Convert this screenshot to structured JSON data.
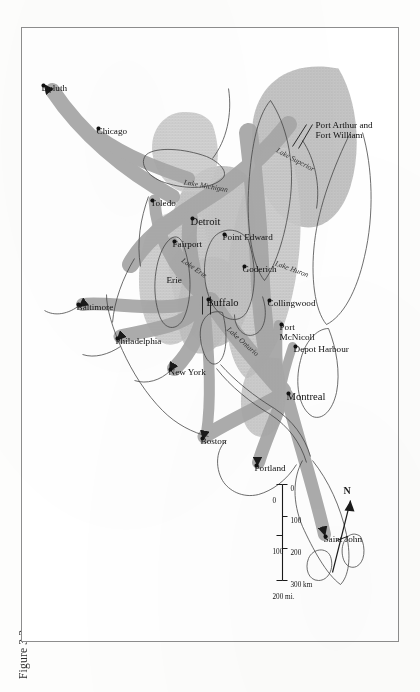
{
  "figure": {
    "caption": "Figure 3.3",
    "plate_kind": "map"
  },
  "map": {
    "title": "",
    "orientation_note": "map printed rotated 90 degrees on the page",
    "north_arrow": {
      "label": "N",
      "icon": "north-arrow-icon"
    },
    "scale_bar": {
      "km": {
        "unit_label": "300 km",
        "ticks": [
          "0",
          "100",
          "200",
          "300 km"
        ]
      },
      "mi": {
        "unit_label": "200 mi.",
        "ticks": [
          "0",
          "100",
          "200 mi."
        ]
      }
    },
    "places": [
      {
        "name": "Saint John",
        "x": 508,
        "y": 73,
        "rot": -90,
        "size": "city",
        "dot": true,
        "dx": -2,
        "dy": 2
      },
      {
        "name": "Portland",
        "x": 437,
        "y": 142,
        "rot": -90,
        "size": "city",
        "dot": true,
        "dx": -2,
        "dy": 2
      },
      {
        "name": "Boston",
        "x": 410,
        "y": 196,
        "rot": -90,
        "size": "city",
        "dot": true,
        "dx": -2,
        "dy": 2
      },
      {
        "name": "New York",
        "x": 341,
        "y": 228,
        "rot": -90,
        "size": "city",
        "dot": true,
        "dx": -2,
        "dy": 2
      },
      {
        "name": "Philadelphia",
        "x": 310,
        "y": 281,
        "rot": -90,
        "size": "city",
        "dot": true,
        "dx": -2,
        "dy": 2
      },
      {
        "name": "Baltimore",
        "x": 276,
        "y": 320,
        "rot": -90,
        "size": "city",
        "dot": true,
        "dx": -2,
        "dy": 2
      },
      {
        "name": "Montreal",
        "x": 365,
        "y": 110,
        "rot": -90,
        "size": "big",
        "dot": true,
        "dx": -2,
        "dy": 2
      },
      {
        "name": "Buffalo",
        "x": 271,
        "y": 190,
        "rot": -90,
        "size": "big",
        "dot": true,
        "dx": -2,
        "dy": 2
      },
      {
        "name": "Erie",
        "x": 247,
        "y": 232,
        "rot": -90,
        "size": "city",
        "dot": false,
        "dx": 0,
        "dy": 0
      },
      {
        "name": "Fairport",
        "x": 213,
        "y": 224,
        "rot": -90,
        "size": "city",
        "dot": true,
        "dx": -2,
        "dy": 2
      },
      {
        "name": "Toledo",
        "x": 172,
        "y": 246,
        "rot": -90,
        "size": "city",
        "dot": true,
        "dx": -2,
        "dy": 2
      },
      {
        "name": "Detroit",
        "x": 190,
        "y": 206,
        "rot": -90,
        "size": "big",
        "dot": true,
        "dx": -2,
        "dy": 2
      },
      {
        "name": "Point Edward",
        "x": 206,
        "y": 174,
        "rot": -90,
        "size": "city",
        "dot": true,
        "dx": -2,
        "dy": 2
      },
      {
        "name": "Goderich",
        "x": 238,
        "y": 154,
        "rot": -90,
        "size": "city",
        "dot": true,
        "dx": -2,
        "dy": 2
      },
      {
        "name": "Collingwood",
        "x": 272,
        "y": 129,
        "rot": -90,
        "size": "city",
        "dot": true,
        "dx": -2,
        "dy": 2
      },
      {
        "name": "Port\nMcNicoll",
        "x": 296,
        "y": 117,
        "rot": -90,
        "size": "two",
        "dot": true,
        "dx": -2,
        "dy": 2
      },
      {
        "name": "Depot Harbour",
        "x": 318,
        "y": 103,
        "rot": -90,
        "size": "city",
        "dot": true,
        "dx": -2,
        "dy": 2
      },
      {
        "name": "Chicago",
        "x": 100,
        "y": 300,
        "rot": -90,
        "size": "city",
        "dot": true,
        "dx": -2,
        "dy": 2
      },
      {
        "name": "Duluth",
        "x": 57,
        "y": 355,
        "rot": -90,
        "size": "city",
        "dot": true,
        "dx": -2,
        "dy": 2
      },
      {
        "name": "Port Arthur and\nFort William",
        "x": 92,
        "y": 83,
        "rot": -90,
        "size": "two",
        "dot": false,
        "dx": 0,
        "dy": 0
      }
    ],
    "water_labels": [
      {
        "name": "Lake Superior",
        "x": 118,
        "y": 120,
        "rot": -62
      },
      {
        "name": "Lake Huron",
        "x": 231,
        "y": 122,
        "rot": -70
      },
      {
        "name": "Lake Michigan",
        "x": 150,
        "y": 214,
        "rot": -80
      },
      {
        "name": "Lake Erie",
        "x": 228,
        "y": 214,
        "rot": -55
      },
      {
        "name": "Lake Ontario",
        "x": 297,
        "y": 168,
        "rot": -48
      }
    ],
    "colors": {
      "flow_band": "#a9a9a9",
      "land_tint": "#b8b8b8",
      "coastline": "#4a4a4a",
      "frame": "#8d8d8d",
      "text": "#111111"
    }
  }
}
